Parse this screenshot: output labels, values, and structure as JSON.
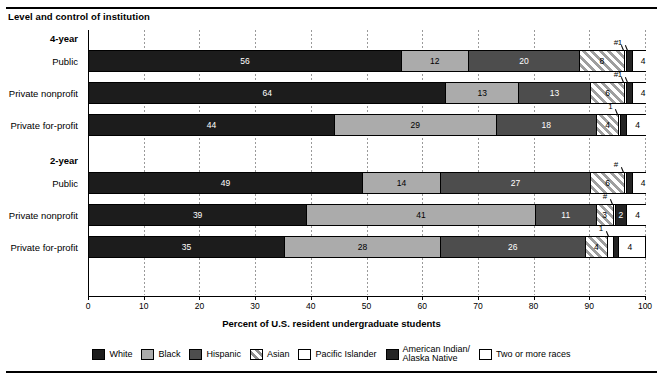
{
  "subtitle": "Level and control of institution",
  "axis_title": "Percent of U.S. resident undergraduate students",
  "groups": [
    {
      "label": "4-year"
    },
    {
      "label": "2-year"
    }
  ],
  "row_labels": [
    "Public",
    "Private nonprofit",
    "Private for-profit",
    "Public",
    "Private nonprofit",
    "Private for-profit"
  ],
  "ticks": [
    "0",
    "10",
    "20",
    "30",
    "40",
    "50",
    "60",
    "70",
    "80",
    "90",
    "100"
  ],
  "legend": [
    {
      "name": "White",
      "key": "white",
      "color": "#1c1c1c"
    },
    {
      "name": "Black",
      "key": "black",
      "color": "#ababab"
    },
    {
      "name": "Hispanic",
      "key": "hispanic",
      "color": "#4d4d4d"
    },
    {
      "name": "Asian",
      "key": "asian",
      "color": "#9f9f9f"
    },
    {
      "name": "Pacific Islander",
      "key": "pacific-islander",
      "color": "#ffffff"
    },
    {
      "name": "American Indian/\nAlaska Native",
      "key": "american-indian-alaska-native",
      "color": "#242424"
    },
    {
      "name": "Two or more races",
      "key": "two-or-more-races",
      "color": "#ffffff"
    }
  ],
  "chart_data": {
    "type": "bar",
    "orientation": "horizontal",
    "stacked": true,
    "title": "",
    "subtitle": "Level and control of institution",
    "xlabel": "Percent of U.S. resident undergraduate students",
    "ylabel": "",
    "xlim": [
      0,
      100
    ],
    "xticks": [
      0,
      10,
      20,
      30,
      40,
      50,
      60,
      70,
      80,
      90,
      100
    ],
    "grid": true,
    "legend_position": "bottom",
    "categories": [
      "4-year Public",
      "4-year Private nonprofit",
      "4-year Private for-profit",
      "2-year Public",
      "2-year Private nonprofit",
      "2-year Private for-profit"
    ],
    "series": [
      {
        "name": "White",
        "values": [
          56,
          64,
          44,
          49,
          39,
          35
        ]
      },
      {
        "name": "Black",
        "values": [
          12,
          13,
          29,
          14,
          41,
          28
        ]
      },
      {
        "name": "Hispanic",
        "values": [
          20,
          13,
          18,
          27,
          11,
          26
        ]
      },
      {
        "name": "Asian",
        "values": [
          8,
          6,
          4,
          6,
          3,
          4
        ]
      },
      {
        "name": "Pacific Islander",
        "values": [
          0.4,
          0.4,
          0.4,
          0.4,
          0.4,
          1
        ]
      },
      {
        "name": "American Indian/Alaska Native",
        "values": [
          1,
          1,
          1,
          1,
          2,
          1
        ]
      },
      {
        "name": "Two or more races",
        "values": [
          4,
          4,
          4,
          4,
          4,
          4
        ]
      }
    ],
    "rows": [
      {
        "category": "4-year Public",
        "segments": [
          {
            "series": "White",
            "value": 56,
            "label": "56"
          },
          {
            "series": "Black",
            "value": 12,
            "label": "12"
          },
          {
            "series": "Hispanic",
            "value": 20,
            "label": "20"
          },
          {
            "series": "Asian",
            "value": 8,
            "label": "8"
          },
          {
            "series": "Pacific Islander",
            "value": 0.4,
            "label": "#",
            "callout": true
          },
          {
            "series": "American Indian/Alaska Native",
            "value": 1,
            "label": "1",
            "callout": true
          },
          {
            "series": "Two or more races",
            "value": 4,
            "label": "4"
          }
        ]
      },
      {
        "category": "4-year Private nonprofit",
        "segments": [
          {
            "series": "White",
            "value": 64,
            "label": "64"
          },
          {
            "series": "Black",
            "value": 13,
            "label": "13"
          },
          {
            "series": "Hispanic",
            "value": 13,
            "label": "13"
          },
          {
            "series": "Asian",
            "value": 6,
            "label": "6"
          },
          {
            "series": "Pacific Islander",
            "value": 0.4,
            "label": "#",
            "callout": true
          },
          {
            "series": "American Indian/Alaska Native",
            "value": 1,
            "label": "1",
            "callout": true
          },
          {
            "series": "Two or more races",
            "value": 4,
            "label": "4"
          }
        ]
      },
      {
        "category": "4-year Private for-profit",
        "segments": [
          {
            "series": "White",
            "value": 44,
            "label": "44"
          },
          {
            "series": "Black",
            "value": 29,
            "label": "29"
          },
          {
            "series": "Hispanic",
            "value": 18,
            "label": "18"
          },
          {
            "series": "Asian",
            "value": 4,
            "label": "4"
          },
          {
            "series": "Pacific Islander",
            "value": 0.4,
            "label": "1",
            "callout": true
          },
          {
            "series": "American Indian/Alaska Native",
            "value": 1,
            "label": "1"
          },
          {
            "series": "Two or more races",
            "value": 4,
            "label": "4"
          }
        ]
      },
      {
        "category": "2-year Public",
        "segments": [
          {
            "series": "White",
            "value": 49,
            "label": "49"
          },
          {
            "series": "Black",
            "value": 14,
            "label": "14"
          },
          {
            "series": "Hispanic",
            "value": 27,
            "label": "27"
          },
          {
            "series": "Asian",
            "value": 6,
            "label": "6"
          },
          {
            "series": "Pacific Islander",
            "value": 0.4,
            "label": "#",
            "callout": true
          },
          {
            "series": "American Indian/Alaska Native",
            "value": 1,
            "label": "1"
          },
          {
            "series": "Two or more races",
            "value": 4,
            "label": "4"
          }
        ]
      },
      {
        "category": "2-year Private nonprofit",
        "segments": [
          {
            "series": "White",
            "value": 39,
            "label": "39"
          },
          {
            "series": "Black",
            "value": 41,
            "label": "41"
          },
          {
            "series": "Hispanic",
            "value": 11,
            "label": "11"
          },
          {
            "series": "Asian",
            "value": 3,
            "label": "3"
          },
          {
            "series": "Pacific Islander",
            "value": 0.4,
            "label": "#",
            "callout": true
          },
          {
            "series": "American Indian/Alaska Native",
            "value": 2,
            "label": "2"
          },
          {
            "series": "Two or more races",
            "value": 4,
            "label": "4"
          }
        ]
      },
      {
        "category": "2-year Private for-profit",
        "segments": [
          {
            "series": "White",
            "value": 35,
            "label": "35"
          },
          {
            "series": "Black",
            "value": 28,
            "label": "28"
          },
          {
            "series": "Hispanic",
            "value": 26,
            "label": "26"
          },
          {
            "series": "Asian",
            "value": 4,
            "label": "4"
          },
          {
            "series": "Pacific Islander",
            "value": 1,
            "label": "1",
            "callout": true
          },
          {
            "series": "American Indian/Alaska Native",
            "value": 1,
            "label": "1"
          },
          {
            "series": "Two or more races",
            "value": 4,
            "label": "4"
          }
        ]
      }
    ]
  }
}
